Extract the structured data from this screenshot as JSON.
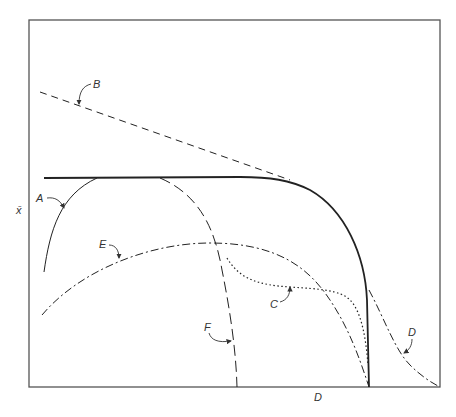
{
  "diagram": {
    "axes": {
      "y_label": "x̄",
      "x_label": "D"
    },
    "curves": [
      {
        "id": "A",
        "label": "A",
        "style": "solid"
      },
      {
        "id": "B",
        "label": "B",
        "style": "dashed"
      },
      {
        "id": "C",
        "label": "C",
        "style": "dotted"
      },
      {
        "id": "D",
        "label": "D",
        "style": "dash-dot"
      },
      {
        "id": "E",
        "label": "E",
        "style": "dash-dot"
      },
      {
        "id": "F",
        "label": "F",
        "style": "long-dash"
      }
    ],
    "colors": {
      "ink": "#222222",
      "frame": "#555555",
      "background": "#ffffff"
    }
  }
}
